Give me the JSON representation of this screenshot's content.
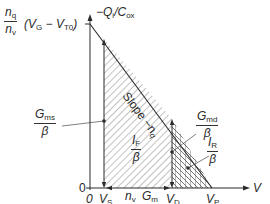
{
  "diagram": {
    "y_axis": {
      "top_label_numerator": "n",
      "top_label_numerator_sub": "q",
      "top_label_denominator": "n",
      "top_label_denominator_sub": "v",
      "top_label_expr_a": "(V",
      "top_label_expr_a_sub": "G",
      "top_label_expr_b": " − V",
      "top_label_expr_b_sub": "T0",
      "top_label_expr_c": ")",
      "axis_title": "−Q",
      "axis_title_sub": "i",
      "axis_title_rest": "/C",
      "axis_title_rest_sub": "ox",
      "zero_label": "0"
    },
    "x_axis": {
      "title": "V",
      "origin_label": "0",
      "vs_label": "V",
      "vs_sub": "S",
      "vd_label": "V",
      "vd_sub": "D",
      "vp_label": "V",
      "vp_sub": "P"
    },
    "annotations": {
      "slope_label": "Slope −n",
      "slope_sub": "q",
      "gms_num": "G",
      "gms_num_sub": "ms",
      "gms_den": "β",
      "if_num": "I",
      "if_num_sub": "F",
      "if_den": "β",
      "gmd_num": "G",
      "gmd_num_sub": "md",
      "gmd_den": "β",
      "ir_num": "I",
      "ir_num_sub": "R",
      "ir_den": "β",
      "gm_ratio_num": "n",
      "gm_ratio_num_sub": "v",
      "gm_ratio_den": "n",
      "gm_ratio_den_sub": "q",
      "gm_num": "G",
      "gm_num_sub": "m",
      "gm_den": "β"
    },
    "colors": {
      "line": "#2a2a2a",
      "hatch": "#555555",
      "background": "#ffffff"
    }
  }
}
